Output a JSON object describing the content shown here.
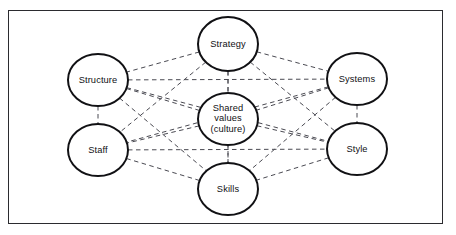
{
  "diagram": {
    "frame": {
      "border_color": "#2b2b2f",
      "background_color": "#ffffff",
      "x": 8,
      "y": 10,
      "width": 435,
      "height": 214
    },
    "style": {
      "node_stroke_color": "#111114",
      "node_fill_color": "#ffffff",
      "node_stroke_width": 2,
      "link_color": "#4a4a52",
      "link_style": "dashed",
      "link_width": 1,
      "label_color": "#111114"
    },
    "nodes": [
      {
        "id": "strategy",
        "label": "Strategy",
        "cx": 228,
        "cy": 44,
        "rx": 30,
        "ry": 27
      },
      {
        "id": "structure",
        "label": "Structure",
        "cx": 98,
        "cy": 80,
        "rx": 30,
        "ry": 26
      },
      {
        "id": "systems",
        "label": "Systems",
        "cx": 357,
        "cy": 79,
        "rx": 30,
        "ry": 26
      },
      {
        "id": "shared-values",
        "label": "Shared\nvalues\n(culture)",
        "cx": 228,
        "cy": 119,
        "rx": 30,
        "ry": 26
      },
      {
        "id": "staff",
        "label": "Staff",
        "cx": 98,
        "cy": 150,
        "rx": 30,
        "ry": 26
      },
      {
        "id": "style",
        "label": "Style",
        "cx": 357,
        "cy": 149,
        "rx": 30,
        "ry": 26
      },
      {
        "id": "skills",
        "label": "Skills",
        "cx": 228,
        "cy": 189,
        "rx": 30,
        "ry": 26
      }
    ],
    "links": [
      {
        "from": "strategy",
        "to": "structure"
      },
      {
        "from": "strategy",
        "to": "systems"
      },
      {
        "from": "strategy",
        "to": "shared-values"
      },
      {
        "from": "strategy",
        "to": "staff"
      },
      {
        "from": "strategy",
        "to": "style"
      },
      {
        "from": "strategy",
        "to": "skills"
      },
      {
        "from": "structure",
        "to": "systems"
      },
      {
        "from": "structure",
        "to": "shared-values"
      },
      {
        "from": "structure",
        "to": "staff"
      },
      {
        "from": "structure",
        "to": "style"
      },
      {
        "from": "structure",
        "to": "skills"
      },
      {
        "from": "systems",
        "to": "shared-values"
      },
      {
        "from": "systems",
        "to": "staff"
      },
      {
        "from": "systems",
        "to": "style"
      },
      {
        "from": "systems",
        "to": "skills"
      },
      {
        "from": "shared-values",
        "to": "staff"
      },
      {
        "from": "shared-values",
        "to": "style"
      },
      {
        "from": "shared-values",
        "to": "skills"
      },
      {
        "from": "staff",
        "to": "style"
      },
      {
        "from": "staff",
        "to": "skills"
      },
      {
        "from": "style",
        "to": "skills"
      }
    ]
  }
}
